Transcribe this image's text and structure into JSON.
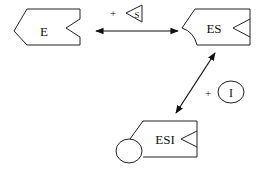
{
  "diagram": {
    "type": "enzyme-inhibition-scheme",
    "nodes": {
      "enzyme": {
        "label": "E",
        "shape": "enzyme-block"
      },
      "enzyme_substrate": {
        "label": "ES",
        "shape": "enzyme-block-with-bound-substrate"
      },
      "enzyme_substrate_inhibitor": {
        "label": "ESI",
        "shape": "enzyme-block-with-bound-substrate-and-inhibitor"
      }
    },
    "reactants": {
      "substrate": {
        "label": "S",
        "prefix": "+",
        "shape": "triangle-wedge"
      },
      "inhibitor": {
        "label": "I",
        "prefix": "+",
        "shape": "circle"
      }
    },
    "edges": [
      {
        "from": "E",
        "to": "ES",
        "type": "reversible",
        "with": "S"
      },
      {
        "from": "ES",
        "to": "ESI",
        "type": "reversible",
        "with": "I"
      }
    ],
    "colors": {
      "stroke": "#111111",
      "background": "#ffffff"
    }
  }
}
